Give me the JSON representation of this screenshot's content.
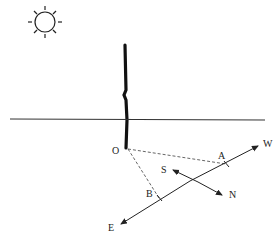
{
  "diagram": {
    "type": "shadow-direction geometry",
    "labels": {
      "O": "O",
      "A": "A",
      "B": "B",
      "S": "S",
      "N": "N",
      "W": "W",
      "E": "E"
    },
    "elements": [
      "sun",
      "pole",
      "ground-line",
      "dashed-OA",
      "dashed-OB",
      "line-EW",
      "line-SN"
    ]
  }
}
